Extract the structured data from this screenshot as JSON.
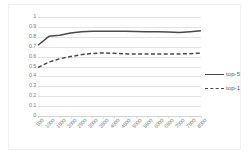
{
  "chart_data": {
    "type": "line",
    "title": "",
    "xlabel": "",
    "ylabel": "",
    "ylim": [
      0,
      1
    ],
    "ytick_labels": [
      "1",
      "0.9",
      "0.8",
      "0.7",
      "0.6",
      "0.5",
      "0.4",
      "0.3",
      "0.2",
      "0.1",
      "0"
    ],
    "ytick_values": [
      1,
      0.9,
      0.8,
      0.7,
      0.6,
      0.5,
      0.4,
      0.3,
      0.2,
      0.1,
      0
    ],
    "grid": true,
    "legend_position": "right",
    "categories": [
      "500",
      "1000",
      "1500",
      "2000",
      "2500",
      "3000",
      "3500",
      "4000",
      "4500",
      "5000",
      "5500",
      "6000",
      "6500",
      "7000",
      "7500",
      "8000"
    ],
    "series": [
      {
        "name": "top-5",
        "style": "solid",
        "color": "#4a4a4a",
        "values": [
          0.715,
          0.805,
          0.815,
          0.838,
          0.852,
          0.856,
          0.857,
          0.856,
          0.855,
          0.853,
          0.852,
          0.85,
          0.848,
          0.843,
          0.852,
          0.86
        ]
      },
      {
        "name": "top-1",
        "style": "dashed",
        "color": "#4a4a4a",
        "values": [
          0.49,
          0.545,
          0.578,
          0.6,
          0.62,
          0.632,
          0.637,
          0.633,
          0.628,
          0.626,
          0.626,
          0.626,
          0.627,
          0.627,
          0.63,
          0.635
        ]
      }
    ]
  },
  "legend": {
    "items": [
      {
        "label": "top-5",
        "style": "solid"
      },
      {
        "label": "top-1",
        "style": "dashed"
      }
    ]
  }
}
